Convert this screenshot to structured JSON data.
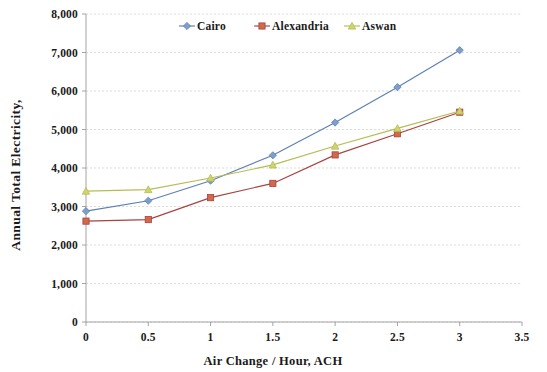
{
  "chart_data": {
    "type": "line",
    "title": "",
    "xlabel": "Air Change / Hour, ACH",
    "ylabel": "Annual Total Electricity,",
    "x": [
      0,
      0.5,
      1,
      1.5,
      2,
      2.5,
      3
    ],
    "xlim": [
      0,
      3.5
    ],
    "ylim": [
      0,
      8000
    ],
    "xticks": [
      "0",
      "0.5",
      "1",
      "1.5",
      "2",
      "2.5",
      "3",
      "3.5"
    ],
    "xtick_values": [
      0,
      0.5,
      1,
      1.5,
      2,
      2.5,
      3,
      3.5
    ],
    "yticks": [
      "0",
      "1,000",
      "2,000",
      "3,000",
      "4,000",
      "5,000",
      "6,000",
      "7,000",
      "8,000"
    ],
    "ytick_values": [
      0,
      1000,
      2000,
      3000,
      4000,
      5000,
      6000,
      7000,
      8000
    ],
    "grid": true,
    "legend_position": "top-center",
    "series": [
      {
        "name": "Cairo",
        "color": "#5b7fb4",
        "marker": "diamond",
        "marker_fill": "#7f9fc9",
        "values": [
          2880,
          3150,
          3670,
          4330,
          5180,
          6100,
          7060
        ]
      },
      {
        "name": "Alexandria",
        "color": "#a8423f",
        "marker": "square",
        "marker_fill": "#d2694b",
        "values": [
          2620,
          2660,
          3230,
          3600,
          4340,
          4890,
          5450
        ]
      },
      {
        "name": "Aswan",
        "color": "#b5bd52",
        "marker": "triangle",
        "marker_fill": "#cfd46e",
        "values": [
          3400,
          3440,
          3740,
          4080,
          4570,
          5030,
          5480
        ]
      }
    ]
  },
  "legend": {
    "items": [
      {
        "label": "Cairo"
      },
      {
        "label": "Alexandria"
      },
      {
        "label": "Aswan"
      }
    ]
  },
  "axes": {
    "x_title": "Air Change / Hour, ACH",
    "y_title": "Annual Total Electricity,"
  }
}
